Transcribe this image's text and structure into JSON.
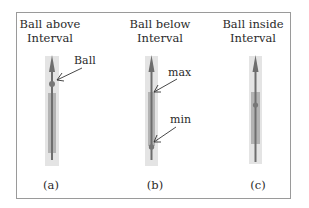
{
  "panels": [
    {
      "title_line1": "Ball above",
      "title_line2": "Interval",
      "caption": "(a)",
      "annotations": [
        "Ball"
      ]
    },
    {
      "title_line1": "Ball below",
      "title_line2": "Interval",
      "caption": "(b)",
      "annotations": [
        "max",
        "min"
      ]
    },
    {
      "title_line1": "Ball inside",
      "title_line2": "Interval",
      "caption": "(c)",
      "annotations": []
    }
  ],
  "colors": {
    "frame": "#9a9a9a",
    "track_bg": "#e4e4e4",
    "interval": "#b3b3b3",
    "rod": "#6e6e6e",
    "ball": "#777777"
  }
}
